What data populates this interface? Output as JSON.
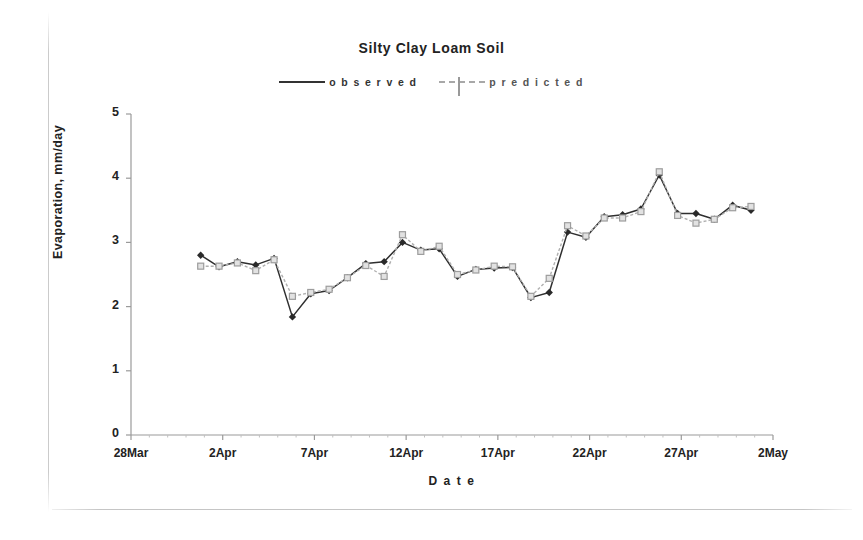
{
  "chart_data": {
    "type": "line",
    "title": "Silty Clay Loam Soil",
    "xlabel": "D a t e",
    "ylabel": "Evaporation, mm/day",
    "ylim": [
      0,
      5
    ],
    "yticks": [
      0,
      1,
      2,
      3,
      4,
      5
    ],
    "xticks": [
      "28Mar",
      "2Apr",
      "7Apr",
      "12Apr",
      "17Apr",
      "22Apr",
      "27Apr",
      "2May"
    ],
    "xlim_days": [
      0,
      35
    ],
    "xtick_days": [
      0,
      5,
      10,
      15,
      20,
      25,
      30,
      35
    ],
    "grid": false,
    "legend_position": "top-center",
    "x_days": [
      3.8,
      4.8,
      5.8,
      6.8,
      7.8,
      8.8,
      9.8,
      10.8,
      11.8,
      12.8,
      13.8,
      14.8,
      15.8,
      16.8,
      17.8,
      18.8,
      19.8,
      20.8,
      21.8,
      22.8,
      23.8,
      24.8,
      25.8,
      26.8,
      27.8,
      28.8,
      29.8,
      30.8,
      31.8,
      32.8,
      33.8
    ],
    "series": [
      {
        "name": "observed",
        "color": "#2f2f2f",
        "marker": "diamond",
        "linestyle": "solid",
        "values": [
          2.8,
          2.62,
          2.7,
          2.65,
          2.75,
          1.84,
          2.2,
          2.25,
          2.45,
          2.67,
          2.7,
          3.0,
          2.88,
          2.9,
          2.47,
          2.58,
          2.6,
          2.61,
          2.14,
          2.22,
          3.16,
          3.08,
          3.4,
          3.43,
          3.52,
          4.05,
          3.45,
          3.45,
          3.36,
          3.58,
          3.5
        ]
      },
      {
        "name": "predicted",
        "color": "#b0b0b0",
        "marker": "square",
        "linestyle": "dashed",
        "values": [
          2.63,
          2.63,
          2.68,
          2.56,
          2.73,
          2.16,
          2.22,
          2.27,
          2.45,
          2.64,
          2.47,
          3.12,
          2.86,
          2.94,
          2.5,
          2.57,
          2.63,
          2.62,
          2.16,
          2.44,
          3.26,
          3.1,
          3.38,
          3.38,
          3.48,
          4.1,
          3.42,
          3.3,
          3.36,
          3.54,
          3.56
        ]
      }
    ]
  },
  "legend": {
    "observed_label": "o b s e r v e d",
    "predicted_label": "p r e d i c t e d"
  },
  "axes": {
    "y_title": "Evaporation, mm/day",
    "x_title": "D a t e"
  }
}
